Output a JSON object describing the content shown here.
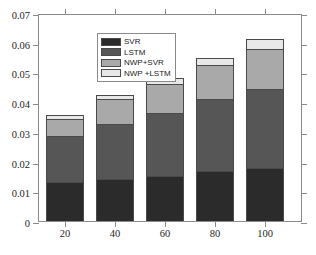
{
  "chart_data": {
    "type": "bar",
    "subtype": "stacked",
    "title": "",
    "xlabel": "",
    "ylabel": "",
    "categories": [
      "20",
      "40",
      "60",
      "80",
      "100"
    ],
    "ylim": [
      0,
      0.07
    ],
    "yticks": [
      "0",
      "0.01",
      "0.02",
      "0.03",
      "0.04",
      "0.05",
      "0.06",
      "0.07"
    ],
    "ytick_values": [
      0,
      0.01,
      0.02,
      0.03,
      0.04,
      0.05,
      0.06,
      0.07
    ],
    "grid": false,
    "legend_position": "upper-left-inside",
    "series": [
      {
        "name": "SVR",
        "color": "#2b2b2b",
        "values": [
          0.013,
          0.014,
          0.0152,
          0.0167,
          0.0178
        ]
      },
      {
        "name": "LSTM",
        "color": "#565656",
        "values": [
          0.0155,
          0.0186,
          0.0211,
          0.0245,
          0.0265
        ]
      },
      {
        "name": "NWP+SVR",
        "color": "#a9a9a9",
        "values": [
          0.006,
          0.0084,
          0.0097,
          0.0113,
          0.0135
        ]
      },
      {
        "name": "NWP +LSTM",
        "color": "#e8e8e8",
        "values": [
          0.0013,
          0.0015,
          0.0022,
          0.0025,
          0.0034
        ]
      }
    ],
    "cumulative_tops": [
      [
        0.013,
        0.0285,
        0.0345,
        0.0358
      ],
      [
        0.014,
        0.0326,
        0.041,
        0.0425
      ],
      [
        0.0152,
        0.0363,
        0.046,
        0.0482
      ],
      [
        0.0167,
        0.0412,
        0.0525,
        0.055
      ],
      [
        0.0178,
        0.0443,
        0.0578,
        0.0612
      ]
    ]
  },
  "legend": {
    "items": [
      {
        "label": "SVR"
      },
      {
        "label": "LSTM"
      },
      {
        "label": "NWP+SVR"
      },
      {
        "label": "NWP +LSTM"
      }
    ]
  }
}
